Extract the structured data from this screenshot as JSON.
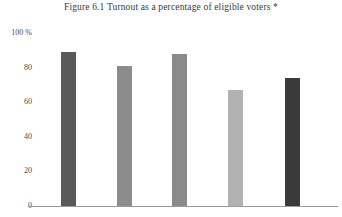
{
  "figure": {
    "title": "Figure 6.1  Turnout as a percentage of eligible voters *",
    "footnote_marker": "*"
  },
  "axes": {
    "y_ticks": [
      {
        "label": "100 %",
        "value": 100
      },
      {
        "label": "80",
        "value": 80
      },
      {
        "label": "60",
        "value": 60
      },
      {
        "label": "40",
        "value": 40
      },
      {
        "label": "20",
        "value": 20
      },
      {
        "label": "0",
        "value": 0
      }
    ],
    "x_tick_labels": [
      "",
      "",
      "",
      "",
      ""
    ],
    "axis_line_color": "#9a9a9a"
  },
  "chart_data": {
    "type": "bar",
    "title": "Figure 6.1  Turnout as a percentage of eligible voters *",
    "xlabel": "",
    "ylabel": "",
    "ylim": [
      0,
      100
    ],
    "grid": false,
    "legend": false,
    "categories": [
      "1",
      "2",
      "3",
      "4",
      "5"
    ],
    "values": [
      89,
      81,
      88,
      67,
      74
    ],
    "bar_colors": [
      "#595959",
      "#8c8c8c",
      "#8a8a8a",
      "#b2b2b2",
      "#3a3a3a"
    ],
    "ytick_labels": [
      "100 %",
      "80",
      "60",
      "40",
      "20",
      "0"
    ],
    "ytick_values": [
      100,
      80,
      60,
      40,
      20,
      0
    ]
  }
}
